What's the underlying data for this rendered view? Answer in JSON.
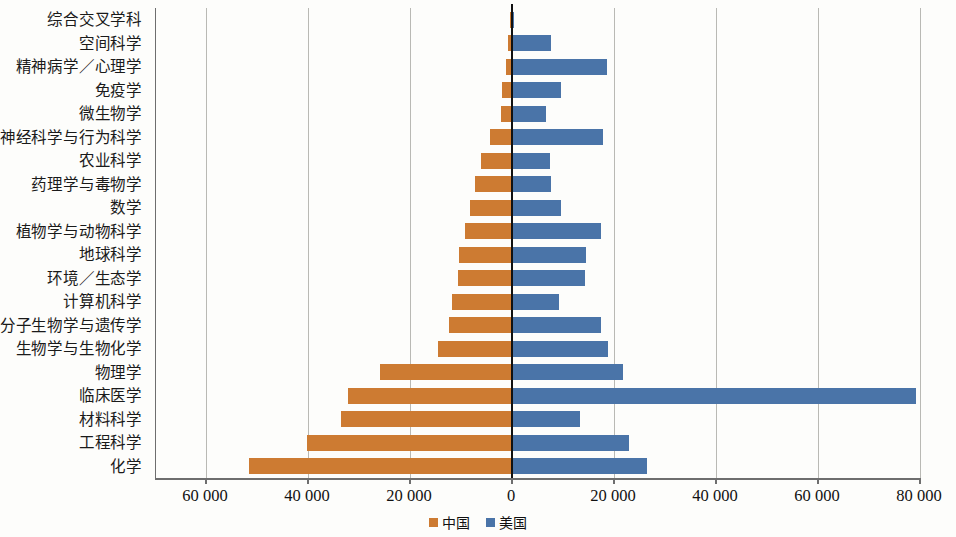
{
  "chart_data": {
    "type": "bar",
    "orientation": "horizontal-diverging",
    "title": "",
    "subtitle": "",
    "xlabel": "",
    "ylabel": "",
    "grid": true,
    "legend_position": "bottom-center",
    "xlim": [
      -65000,
      85000
    ],
    "axis_ticks": [
      {
        "label": "60 000",
        "value": -60000
      },
      {
        "label": "40 000",
        "value": -40000
      },
      {
        "label": "20 000",
        "value": -20000
      },
      {
        "label": "0",
        "value": 0
      },
      {
        "label": "20 000",
        "value": 20000
      },
      {
        "label": "40 000",
        "value": 40000
      },
      {
        "label": "60 000",
        "value": 60000
      },
      {
        "label": "80 000",
        "value": 80000
      }
    ],
    "categories": [
      "综合交叉学科",
      "空间科学",
      "精神病学／心理学",
      "免疫学",
      "微生物学",
      "神经科学与行为科学",
      "农业科学",
      "药理学与毒物学",
      "数学",
      "植物学与动物科学",
      "地球科学",
      "环境／生态学",
      "计算机科学",
      "分子生物学与遗传学",
      "生物学与生物化学",
      "物理学",
      "临床医学",
      "材料科学",
      "工程科学",
      "化学"
    ],
    "series": [
      {
        "name": "中国",
        "color": "#cd7b32",
        "direction": "left",
        "values": [
          300,
          800,
          1200,
          2000,
          2100,
          4400,
          6000,
          7300,
          8300,
          9300,
          10300,
          10500,
          11700,
          12300,
          14500,
          25800,
          32200,
          33500,
          40200,
          51500
        ]
      },
      {
        "name": "美国",
        "color": "#4a74a8",
        "direction": "right",
        "values": [
          400,
          7700,
          18700,
          9600,
          6700,
          17900,
          7400,
          7600,
          9600,
          17500,
          14600,
          14400,
          9300,
          17500,
          18900,
          21800,
          79200,
          13400,
          23000,
          26500
        ]
      }
    ]
  },
  "legend": {
    "items": [
      {
        "label": "中国",
        "color": "#cd7b32"
      },
      {
        "label": "美国",
        "color": "#4a74a8"
      }
    ]
  }
}
